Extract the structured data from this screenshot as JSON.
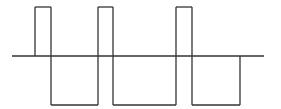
{
  "diagram": {
    "type": "bipolar pulse waveform",
    "line_color": "#333333",
    "background_color": "#ffffff",
    "levels": {
      "high": 1,
      "zero": 0,
      "low": -1
    },
    "segments": [
      {
        "state": "zero",
        "duration": 2.3
      },
      {
        "state": "high",
        "duration": 1.6
      },
      {
        "state": "low",
        "duration": 4.7
      },
      {
        "state": "high",
        "duration": 1.5
      },
      {
        "state": "low",
        "duration": 6.3
      },
      {
        "state": "high",
        "duration": 1.6
      },
      {
        "state": "low",
        "duration": 4.8
      },
      {
        "state": "zero",
        "duration": 2.4
      }
    ]
  }
}
